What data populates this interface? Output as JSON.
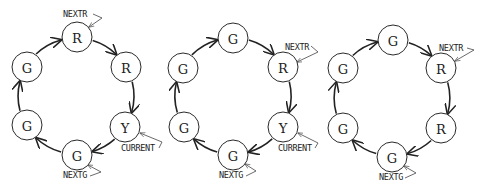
{
  "diagrams": [
    {
      "id": "state-1",
      "center": [
        76,
        96
      ],
      "nodes": [
        {
          "label": "R",
          "x": 77,
          "y": 37
        },
        {
          "label": "R",
          "x": 126,
          "y": 67
        },
        {
          "label": "Y",
          "x": 125,
          "y": 127
        },
        {
          "label": "G",
          "x": 77,
          "y": 155
        },
        {
          "label": "G",
          "x": 27,
          "y": 125
        },
        {
          "label": "G",
          "x": 27,
          "y": 67
        }
      ],
      "pointers": [
        {
          "label": "NEXTR",
          "node": 0,
          "text_x": 63,
          "text_y": 17,
          "elbow": [
            102,
            18
          ],
          "tip": [
            89,
            27
          ],
          "stub": [
            93,
            14
          ]
        },
        {
          "label": "CURRENT",
          "node": 2,
          "text_x": 121,
          "text_y": 151,
          "elbow": [
            162,
            142
          ],
          "tip": [
            140,
            133
          ],
          "stub": [
            159,
            148
          ]
        },
        {
          "label": "NEXTG",
          "node": 3,
          "text_x": 63,
          "text_y": 178,
          "elbow": [
            101,
            172
          ],
          "tip": [
            88,
            165
          ],
          "stub": [
            90,
            176
          ]
        }
      ]
    },
    {
      "id": "state-2",
      "center": [
        233,
        96
      ],
      "nodes": [
        {
          "label": "G",
          "x": 233,
          "y": 38
        },
        {
          "label": "R",
          "x": 283,
          "y": 67
        },
        {
          "label": "Y",
          "x": 283,
          "y": 127
        },
        {
          "label": "G",
          "x": 233,
          "y": 155
        },
        {
          "label": "G",
          "x": 184,
          "y": 127
        },
        {
          "label": "G",
          "x": 183,
          "y": 68
        }
      ],
      "pointers": [
        {
          "label": "NEXTR",
          "node": 1,
          "text_x": 285,
          "text_y": 50,
          "elbow": [
            318,
            52
          ],
          "tip": [
            297,
            62
          ],
          "stub": [
            311,
            46
          ]
        },
        {
          "label": "CURRENT",
          "node": 2,
          "text_x": 278,
          "text_y": 151,
          "elbow": [
            318,
            143
          ],
          "tip": [
            298,
            133
          ],
          "stub": [
            315,
            148
          ]
        },
        {
          "label": "NEXTG",
          "node": 3,
          "text_x": 219,
          "text_y": 178,
          "elbow": [
            256,
            171
          ],
          "tip": [
            245,
            164
          ],
          "stub": [
            246,
            176
          ]
        }
      ]
    },
    {
      "id": "state-3",
      "center": [
        392,
        98
      ],
      "nodes": [
        {
          "label": "G",
          "x": 393,
          "y": 40
        },
        {
          "label": "R",
          "x": 441,
          "y": 68
        },
        {
          "label": "R",
          "x": 441,
          "y": 128
        },
        {
          "label": "G",
          "x": 392,
          "y": 157
        },
        {
          "label": "G",
          "x": 343,
          "y": 128
        },
        {
          "label": "G",
          "x": 343,
          "y": 68
        }
      ],
      "pointers": [
        {
          "label": "NEXTR",
          "node": 1,
          "text_x": 439,
          "text_y": 51,
          "elbow": [
            474,
            50
          ],
          "tip": [
            455,
            61
          ],
          "stub": [
            467,
            48
          ]
        },
        {
          "label": "NEXTG",
          "node": 3,
          "text_x": 379,
          "text_y": 180,
          "elbow": [
            416,
            173
          ],
          "tip": [
            404,
            166
          ],
          "stub": [
            405,
            178
          ]
        }
      ]
    }
  ],
  "style": {
    "node_radius": 15,
    "stroke_color": "#222222",
    "background": "#ffffff"
  }
}
